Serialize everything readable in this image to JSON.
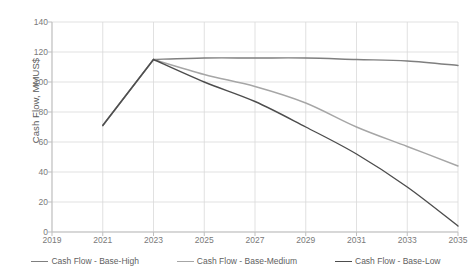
{
  "chart_data": {
    "type": "line",
    "title": "",
    "xlabel": "",
    "ylabel": "Cash Flow, MMUS$",
    "x": [
      2019,
      2021,
      2023,
      2025,
      2027,
      2029,
      2031,
      2033,
      2035
    ],
    "xlim": [
      2019,
      2035
    ],
    "ylim": [
      0,
      140
    ],
    "yticks": [
      0,
      20,
      40,
      60,
      80,
      100,
      120,
      140
    ],
    "xticks": [
      2019,
      2021,
      2023,
      2025,
      2027,
      2029,
      2031,
      2033,
      2035
    ],
    "xtick_labels": [
      "2019",
      "2021",
      "2023",
      "2025",
      "2027",
      "2029",
      "2031",
      "2033",
      "2035"
    ],
    "ytick_labels": [
      "0",
      "20",
      "40",
      "60",
      "80",
      "100",
      "120",
      "140"
    ],
    "grid": true,
    "grid_axis": "both",
    "legend_position": "bottom",
    "series": [
      {
        "name": "Cash Flow - Base-High",
        "color": "#7f7f7f",
        "x": [
          2021,
          2023,
          2025,
          2027,
          2029,
          2031,
          2033,
          2035
        ],
        "values": [
          71,
          115,
          116,
          116,
          116,
          115,
          114,
          111
        ]
      },
      {
        "name": "Cash Flow - Base-Medium",
        "color": "#a6a6a6",
        "x": [
          2021,
          2023,
          2025,
          2027,
          2029,
          2031,
          2033,
          2035
        ],
        "values": [
          71,
          115,
          105,
          97,
          86,
          70,
          57,
          44
        ]
      },
      {
        "name": "Cash Flow - Base-Low",
        "color": "#4d4d4d",
        "x": [
          2021,
          2023,
          2025,
          2027,
          2029,
          2031,
          2033,
          2035
        ],
        "values": [
          71,
          115,
          100,
          87,
          70,
          52,
          30,
          4
        ]
      }
    ]
  },
  "legend": {
    "items": [
      {
        "label": "Cash Flow - Base-High",
        "color": "#7f7f7f"
      },
      {
        "label": "Cash Flow - Base-Medium",
        "color": "#a6a6a6"
      },
      {
        "label": "Cash Flow - Base-Low",
        "color": "#4d4d4d"
      }
    ]
  },
  "axes": {
    "y_title": "Cash Flow, MMUS$"
  },
  "colors": {
    "grid": "#d9d9d9",
    "axis": "#bfbfbf",
    "tick_text": "#7a7a7a",
    "title_text": "#5a5a5a",
    "background": "#ffffff"
  }
}
